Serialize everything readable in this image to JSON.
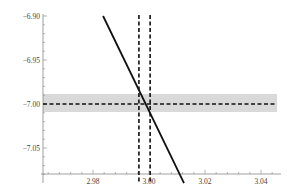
{
  "chart_data": {
    "type": "line",
    "title": "",
    "xlabel": "",
    "ylabel": "",
    "xlim": [
      2.963,
      3.047
    ],
    "ylim": [
      -7.1,
      -6.9
    ],
    "grid": false,
    "legend": null,
    "x_ticks": [
      {
        "value": 2.98,
        "label": "2.98"
      },
      {
        "value": 3.0,
        "label": "3.00"
      },
      {
        "value": 3.02,
        "label": "3.02"
      },
      {
        "value": 3.04,
        "label": "3.04"
      }
    ],
    "y_ticks": [
      {
        "value": -6.9,
        "label": "−6.90"
      },
      {
        "value": -6.95,
        "label": "−6.95"
      },
      {
        "value": -7.0,
        "label": "−7.00"
      },
      {
        "value": -7.05,
        "label": "−7.05"
      }
    ],
    "series": [
      {
        "name": "solid-line",
        "style": "solid",
        "color": "#111111",
        "x": [
          2.9836,
          3.0125
        ],
        "y": [
          -6.9,
          -7.09
        ]
      },
      {
        "name": "horizontal-dashed-line",
        "style": "dashed",
        "color": "#111111",
        "y_const": -7.0
      },
      {
        "name": "vertical-dashed-line-left",
        "style": "dashed",
        "color": "#111111",
        "x_const": 2.9964
      },
      {
        "name": "vertical-dashed-line-right",
        "style": "dashed",
        "color": "#111111",
        "x_const": 3.0004
      }
    ],
    "bands": [
      {
        "name": "horizontal-uncertainty-band",
        "axis": "y",
        "from": -7.0091,
        "to": -6.9886,
        "color": "#d9d9d9"
      }
    ],
    "axes": {
      "x_axis_at_y": -7.0795,
      "y_axis_at_x": 2.9657
    }
  },
  "colors": {
    "axis": "#888888",
    "band": "#d9d9d9",
    "line": "#111111",
    "text": "#444444"
  }
}
